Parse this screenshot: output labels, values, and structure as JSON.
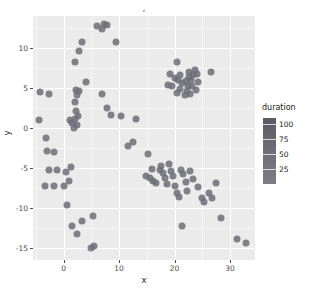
{
  "chart_data": {
    "type": "scatter",
    "title": ",",
    "xlabel": "x",
    "ylabel": "y",
    "xlim": [
      -5.5,
      34.5
    ],
    "ylim": [
      -16.5,
      14.0
    ],
    "xticks": [
      0,
      10,
      20,
      30
    ],
    "yticks": [
      10,
      5,
      0,
      -5,
      -10,
      -15
    ],
    "xtick_labels": [
      "0",
      "10",
      "20",
      "30"
    ],
    "ytick_labels": [
      "10",
      "5",
      "0",
      "-5",
      "-10",
      "-15"
    ],
    "grid": true,
    "grid_color": "#ffffff",
    "panel_background": "#ebebeb",
    "point_color": "#6d6d78",
    "point_opacity": 0.85,
    "point_size": 7,
    "legend": {
      "title": "duration",
      "position": "right",
      "type": "colorbar",
      "ticks": [
        100,
        75,
        50,
        25
      ],
      "tick_labels": [
        "100",
        "75",
        "50",
        "25"
      ],
      "range": [
        0,
        110
      ],
      "gradient_top": "#5a5a68",
      "gradient_bottom": "#7d7d86"
    },
    "series": [
      {
        "name": "duration",
        "points": [
          {
            "x": -4.2,
            "y": 4.5,
            "duration": 60
          },
          {
            "x": -2.6,
            "y": 4.3,
            "duration": 58
          },
          {
            "x": -4.4,
            "y": 1.0,
            "duration": 55
          },
          {
            "x": -3.1,
            "y": -1.2,
            "duration": 52
          },
          {
            "x": -3.0,
            "y": -2.9,
            "duration": 49
          },
          {
            "x": -1.7,
            "y": -3.0,
            "duration": 47
          },
          {
            "x": -2.6,
            "y": -5.3,
            "duration": 45
          },
          {
            "x": -1.2,
            "y": -5.2,
            "duration": 44
          },
          {
            "x": -3.4,
            "y": -7.3,
            "duration": 42
          },
          {
            "x": -1.8,
            "y": -7.2,
            "duration": 41
          },
          {
            "x": 0.4,
            "y": -5.5,
            "duration": 43
          },
          {
            "x": 1.0,
            "y": -6.6,
            "duration": 40
          },
          {
            "x": 1.4,
            "y": -4.9,
            "duration": 46
          },
          {
            "x": 0.1,
            "y": -7.2,
            "duration": 39
          },
          {
            "x": 0.6,
            "y": -9.6,
            "duration": 36
          },
          {
            "x": 1.1,
            "y": 1.0,
            "duration": 62
          },
          {
            "x": 1.6,
            "y": 0.6,
            "duration": 61
          },
          {
            "x": 2.0,
            "y": 1.1,
            "duration": 63
          },
          {
            "x": 2.4,
            "y": 0.4,
            "duration": 60
          },
          {
            "x": 1.8,
            "y": 0.0,
            "duration": 59
          },
          {
            "x": 2.6,
            "y": 1.5,
            "duration": 64
          },
          {
            "x": 2.2,
            "y": 2.1,
            "duration": 66
          },
          {
            "x": 2.0,
            "y": 3.3,
            "duration": 69
          },
          {
            "x": 2.4,
            "y": 4.1,
            "duration": 71
          },
          {
            "x": 2.8,
            "y": 4.6,
            "duration": 73
          },
          {
            "x": 2.2,
            "y": 4.8,
            "duration": 74
          },
          {
            "x": 2.1,
            "y": 8.2,
            "duration": 82
          },
          {
            "x": 2.8,
            "y": 9.6,
            "duration": 86
          },
          {
            "x": 3.4,
            "y": 10.8,
            "duration": 90
          },
          {
            "x": 1.5,
            "y": -12.3,
            "duration": 28
          },
          {
            "x": 2.4,
            "y": -13.3,
            "duration": 26
          },
          {
            "x": 3.4,
            "y": -11.6,
            "duration": 30
          },
          {
            "x": 4.0,
            "y": 5.8,
            "duration": 76
          },
          {
            "x": 5.0,
            "y": -15.0,
            "duration": 22
          },
          {
            "x": 5.5,
            "y": -14.7,
            "duration": 21
          },
          {
            "x": 5.4,
            "y": -11.0,
            "duration": 32
          },
          {
            "x": 6.0,
            "y": 12.7,
            "duration": 96
          },
          {
            "x": 6.9,
            "y": 12.4,
            "duration": 95
          },
          {
            "x": 7.3,
            "y": 13.0,
            "duration": 98
          },
          {
            "x": 7.9,
            "y": 12.9,
            "duration": 97
          },
          {
            "x": 7.0,
            "y": 4.3,
            "duration": 72
          },
          {
            "x": 7.8,
            "y": 2.5,
            "duration": 67
          },
          {
            "x": 8.5,
            "y": 1.6,
            "duration": 65
          },
          {
            "x": 9.5,
            "y": 10.8,
            "duration": 91
          },
          {
            "x": 10.3,
            "y": 1.5,
            "duration": 64
          },
          {
            "x": 11.6,
            "y": -2.2,
            "duration": 53
          },
          {
            "x": 12.6,
            "y": -1.8,
            "duration": 54
          },
          {
            "x": 13.0,
            "y": 1.1,
            "duration": 62
          },
          {
            "x": 15.2,
            "y": -3.3,
            "duration": 50
          },
          {
            "x": 14.8,
            "y": -6.0,
            "duration": 43
          },
          {
            "x": 15.5,
            "y": -6.3,
            "duration": 42
          },
          {
            "x": 16.1,
            "y": -6.6,
            "duration": 41
          },
          {
            "x": 16.6,
            "y": -6.9,
            "duration": 40
          },
          {
            "x": 16.0,
            "y": -5.1,
            "duration": 45
          },
          {
            "x": 17.3,
            "y": -5.2,
            "duration": 45
          },
          {
            "x": 17.6,
            "y": -4.8,
            "duration": 46
          },
          {
            "x": 18.0,
            "y": -5.6,
            "duration": 44
          },
          {
            "x": 18.3,
            "y": -6.3,
            "duration": 42
          },
          {
            "x": 18.6,
            "y": -7.0,
            "duration": 41
          },
          {
            "x": 19.0,
            "y": -4.5,
            "duration": 47
          },
          {
            "x": 19.4,
            "y": -5.4,
            "duration": 45
          },
          {
            "x": 19.8,
            "y": -6.0,
            "duration": 43
          },
          {
            "x": 20.0,
            "y": -7.3,
            "duration": 40
          },
          {
            "x": 20.4,
            "y": -8.1,
            "duration": 38
          },
          {
            "x": 20.8,
            "y": -8.6,
            "duration": 37
          },
          {
            "x": 21.2,
            "y": -5.2,
            "duration": 45
          },
          {
            "x": 21.6,
            "y": -5.8,
            "duration": 44
          },
          {
            "x": 22.0,
            "y": -6.8,
            "duration": 41
          },
          {
            "x": 22.3,
            "y": -7.9,
            "duration": 39
          },
          {
            "x": 21.4,
            "y": -12.2,
            "duration": 29
          },
          {
            "x": 22.8,
            "y": -5.4,
            "duration": 45
          },
          {
            "x": 23.4,
            "y": -6.4,
            "duration": 42
          },
          {
            "x": 24.2,
            "y": -7.4,
            "duration": 40
          },
          {
            "x": 25.0,
            "y": -8.8,
            "duration": 37
          },
          {
            "x": 25.4,
            "y": -9.3,
            "duration": 35
          },
          {
            "x": 26.2,
            "y": -8.1,
            "duration": 38
          },
          {
            "x": 26.8,
            "y": -8.8,
            "duration": 37
          },
          {
            "x": 27.4,
            "y": -6.9,
            "duration": 41
          },
          {
            "x": 28.4,
            "y": -11.2,
            "duration": 32
          },
          {
            "x": 31.2,
            "y": -13.9,
            "duration": 25
          },
          {
            "x": 32.8,
            "y": -14.4,
            "duration": 23
          },
          {
            "x": 20.5,
            "y": 8.2,
            "duration": 83
          },
          {
            "x": 19.5,
            "y": 5.2,
            "duration": 75
          },
          {
            "x": 20.0,
            "y": 6.3,
            "duration": 78
          },
          {
            "x": 20.6,
            "y": 6.0,
            "duration": 77
          },
          {
            "x": 21.0,
            "y": 6.6,
            "duration": 79
          },
          {
            "x": 21.4,
            "y": 5.6,
            "duration": 76
          },
          {
            "x": 21.0,
            "y": 4.9,
            "duration": 74
          },
          {
            "x": 20.4,
            "y": 4.4,
            "duration": 73
          },
          {
            "x": 21.8,
            "y": 4.1,
            "duration": 72
          },
          {
            "x": 22.2,
            "y": 4.6,
            "duration": 74
          },
          {
            "x": 22.4,
            "y": 5.3,
            "duration": 75
          },
          {
            "x": 22.0,
            "y": 5.9,
            "duration": 77
          },
          {
            "x": 22.6,
            "y": 6.4,
            "duration": 79
          },
          {
            "x": 23.0,
            "y": 6.0,
            "duration": 78
          },
          {
            "x": 23.4,
            "y": 6.6,
            "duration": 80
          },
          {
            "x": 23.2,
            "y": 5.2,
            "duration": 75
          },
          {
            "x": 23.8,
            "y": 4.7,
            "duration": 74
          },
          {
            "x": 22.8,
            "y": 4.2,
            "duration": 72
          },
          {
            "x": 24.2,
            "y": 5.7,
            "duration": 77
          },
          {
            "x": 24.0,
            "y": 6.8,
            "duration": 81
          },
          {
            "x": 19.2,
            "y": 6.8,
            "duration": 81
          },
          {
            "x": 18.8,
            "y": 5.4,
            "duration": 76
          },
          {
            "x": 26.6,
            "y": 7.0,
            "duration": 82
          },
          {
            "x": 23.6,
            "y": 7.2,
            "duration": 83
          },
          {
            "x": 22.6,
            "y": 7.0,
            "duration": 82
          }
        ]
      }
    ]
  }
}
